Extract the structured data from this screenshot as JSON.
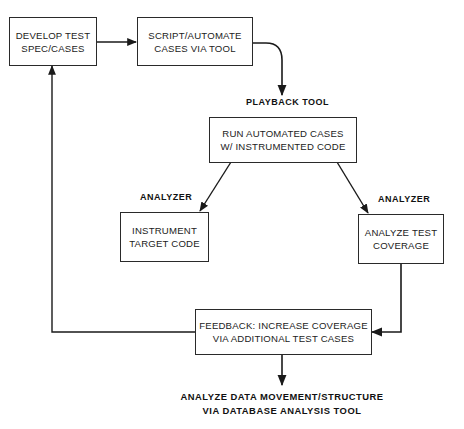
{
  "diagram": {
    "nodes": {
      "develop": {
        "line1": "DEVELOP TEST",
        "line2": "SPEC/CASES"
      },
      "script": {
        "line1": "SCRIPT/AUTOMATE",
        "line2": "CASES VIA TOOL"
      },
      "run": {
        "line1": "RUN AUTOMATED CASES",
        "line2": "W/ INSTRUMENTED CODE"
      },
      "instrument": {
        "line1": "INSTRUMENT",
        "line2": "TARGET CODE"
      },
      "analyze": {
        "line1": "ANALYZE TEST",
        "line2": "COVERAGE"
      },
      "feedback": {
        "line1": "FEEDBACK: INCREASE COVERAGE",
        "line2": "VIA ADDITIONAL TEST CASES"
      }
    },
    "labels": {
      "playback_tool": "PLAYBACK TOOL",
      "analyzer_left": "ANALYZER",
      "analyzer_right": "ANALYZER"
    },
    "caption": {
      "line1": "ANALYZE DATA MOVEMENT/STRUCTURE",
      "line2": "VIA DATABASE ANALYSIS TOOL"
    },
    "edges": [
      {
        "from": "develop",
        "to": "script"
      },
      {
        "from": "script",
        "to": "run",
        "label": "PLAYBACK TOOL"
      },
      {
        "from": "run",
        "to": "instrument",
        "label": "ANALYZER"
      },
      {
        "from": "run",
        "to": "analyze",
        "label": "ANALYZER"
      },
      {
        "from": "analyze",
        "to": "feedback"
      },
      {
        "from": "feedback",
        "to": "develop"
      },
      {
        "from": "feedback",
        "to": "caption"
      }
    ],
    "colors": {
      "line": "#1a1a1a",
      "background": "#ffffff"
    }
  }
}
